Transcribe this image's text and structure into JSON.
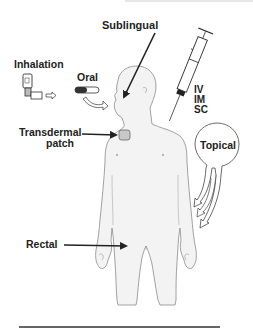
{
  "diagram": {
    "labels": {
      "sublingual": "Sublingual",
      "inhalation": "Inhalation",
      "oral": "Oral",
      "iv": "IV",
      "im": "IM",
      "sc": "SC",
      "transdermal_line1": "Transdermal",
      "transdermal_line2": "patch",
      "topical": "Topical",
      "rectal": "Rectal"
    },
    "colors": {
      "text": "#222222",
      "arrow": "#222222",
      "body_fill": "#f3f3f3",
      "body_outline": "#8a8a8a",
      "patch_fill": "#c8c8c8",
      "rule": "#333333"
    }
  }
}
